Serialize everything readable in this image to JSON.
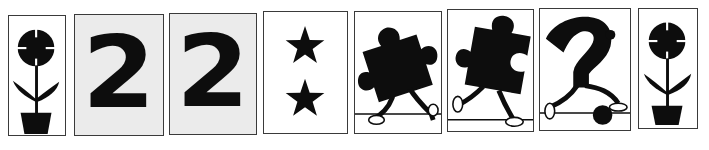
{
  "sequence": {
    "cards": [
      {
        "index": 1,
        "type": "flower-pot",
        "background": "#ffffff"
      },
      {
        "index": 2,
        "type": "digit",
        "value": "2",
        "background": "#ebebeb"
      },
      {
        "index": 3,
        "type": "digit",
        "value": "2",
        "background": "#ebebeb"
      },
      {
        "index": 4,
        "type": "stars",
        "count": 2,
        "background": "#ffffff"
      },
      {
        "index": 5,
        "type": "puzzle-piece-walking",
        "background": "#ffffff"
      },
      {
        "index": 6,
        "type": "puzzle-piece-running",
        "background": "#ffffff"
      },
      {
        "index": 7,
        "type": "question-mark-walking",
        "background": "#ffffff"
      },
      {
        "index": 8,
        "type": "flower-pot",
        "background": "#ffffff"
      }
    ]
  },
  "colors": {
    "ink": "#0d0d0d",
    "border": "#3a3a3a",
    "card_gray": "#ebebeb",
    "card_white": "#ffffff"
  }
}
